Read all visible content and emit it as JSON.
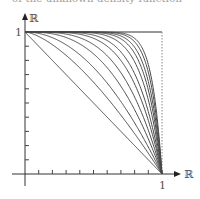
{
  "figure": {
    "cutoff_caption": "of the unknown density function",
    "y_axis_label": "ℝ",
    "x_axis_label": "ℝ",
    "y_tick_label_one": "1",
    "x_tick_label_one": "1",
    "colors": {
      "curve": "#4a4a4a",
      "axis": "#333333",
      "frame": "#333333",
      "dashed": "#888888"
    }
  },
  "chart_data": {
    "type": "line",
    "title": "",
    "xlabel": "ℝ",
    "ylabel": "ℝ",
    "xlim": [
      0,
      1
    ],
    "ylim": [
      0,
      1
    ],
    "x_ticks": 10,
    "y_ticks": 10,
    "grid": false,
    "legend": "none",
    "series": [
      {
        "name": "n=1",
        "exponent": 1
      },
      {
        "name": "n=1.5",
        "exponent": 1.5
      },
      {
        "name": "n=2",
        "exponent": 2
      },
      {
        "name": "n=2.7",
        "exponent": 2.7
      },
      {
        "name": "n=3.5",
        "exponent": 3.5
      },
      {
        "name": "n=4.5",
        "exponent": 4.5
      },
      {
        "name": "n=5.5",
        "exponent": 5.5
      },
      {
        "name": "n=7",
        "exponent": 7
      },
      {
        "name": "n=8.5",
        "exponent": 8.5
      },
      {
        "name": "n=10",
        "exponent": 10
      },
      {
        "name": "n=12",
        "exponent": 12
      },
      {
        "name": "n=14",
        "exponent": 14
      }
    ]
  }
}
